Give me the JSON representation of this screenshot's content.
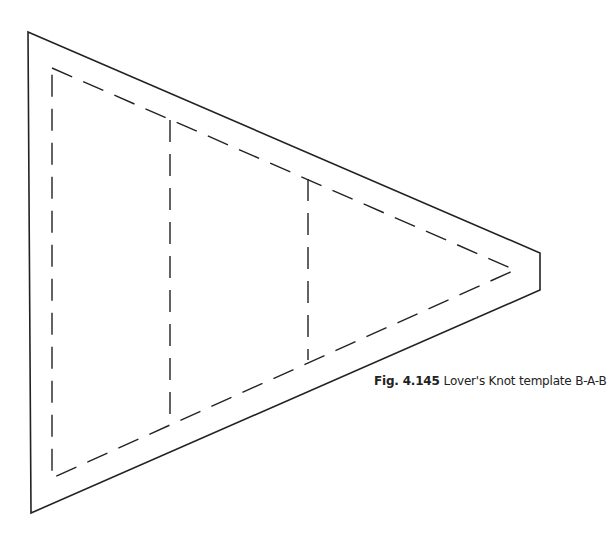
{
  "caption": {
    "figure_label": "Fig. 4.145",
    "title": "Lover's Knot template B-A-B"
  },
  "diagram": {
    "stroke_color": "#222222",
    "outer_shape": "truncated triangle (seam allowance outline)",
    "inner_shape": "dashed triangle (sewing line)",
    "section_divider_count": 2,
    "sections": [
      "B",
      "A",
      "B"
    ]
  }
}
